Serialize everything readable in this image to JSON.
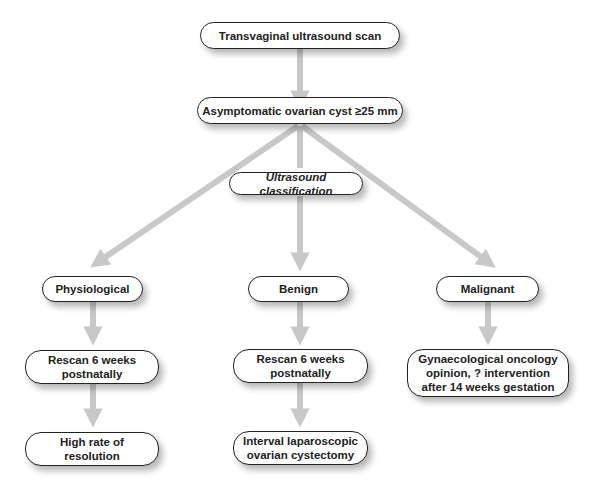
{
  "flowchart": {
    "root": {
      "label": "Transvaginal ultrasound scan"
    },
    "condition": {
      "label": "Asymptomatic ovarian cyst ≥25 mm"
    },
    "classifier": {
      "label": "Ultrasound classification"
    },
    "branches": [
      {
        "category": "Physiological",
        "step1": "Rescan 6 weeks\npostnatally",
        "step2": "High rate of\nresolution"
      },
      {
        "category": "Benign",
        "step1": "Rescan 6 weeks\npostnatally",
        "step2": "Interval laparoscopic\novarian cystectomy"
      },
      {
        "category": "Malignant",
        "step1": "Gynaecological oncology\nopinion, ? intervention\nafter 14 weeks gestation"
      }
    ]
  },
  "colors": {
    "arrow": "#c8c8c8",
    "border": "#222222",
    "text": "#222222"
  }
}
